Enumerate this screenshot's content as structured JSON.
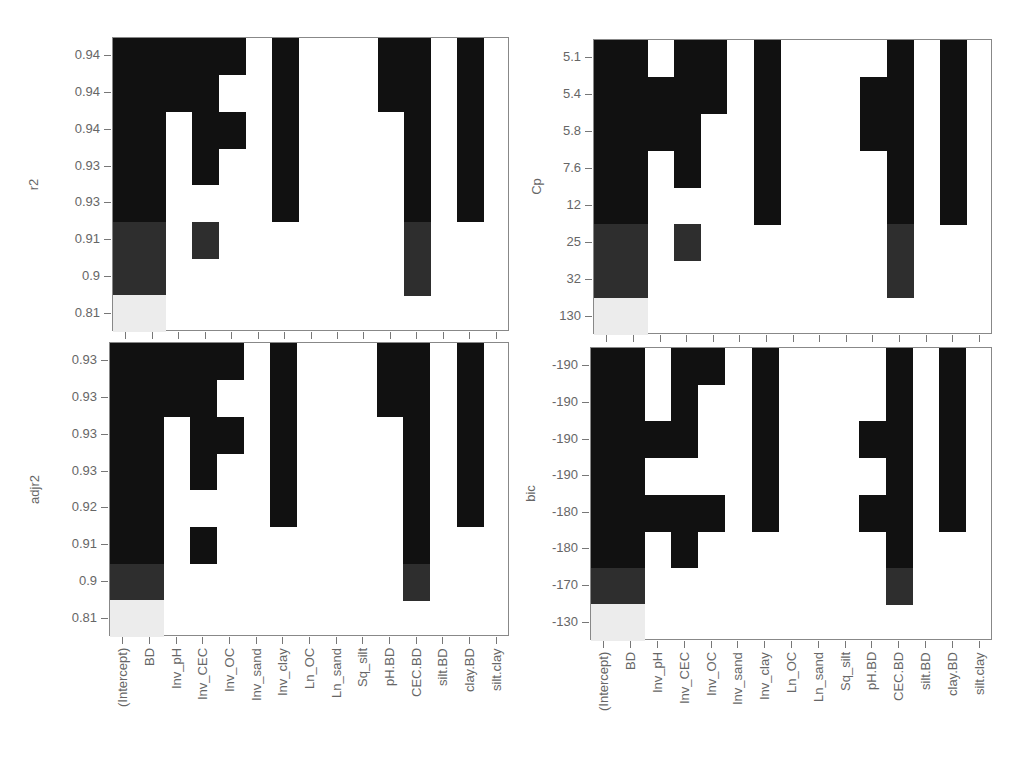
{
  "figure": {
    "columns": [
      "(Intercept)",
      "BD",
      "Inv_pH",
      "Inv_CEC",
      "Inv_OC",
      "Inv_sand",
      "Inv_clay",
      "Ln_OC",
      "Ln_sand",
      "Sq_silt",
      "pH.BD",
      "CEC.BD",
      "silt.BD",
      "clay.BD",
      "silt.clay"
    ],
    "shade_colors": {
      "0": "#ffffff",
      "1": "#ececec",
      "2": "#2e2e2e",
      "3": "#111111"
    }
  },
  "chart_data": [
    {
      "type": "heatmap",
      "title": "",
      "ylabel": "r2",
      "xlabel": "",
      "x": [
        "(Intercept)",
        "BD",
        "Inv_pH",
        "Inv_CEC",
        "Inv_OC",
        "Inv_sand",
        "Inv_clay",
        "Ln_OC",
        "Ln_sand",
        "Sq_silt",
        "pH.BD",
        "CEC.BD",
        "silt.BD",
        "clay.BD",
        "silt.clay"
      ],
      "y_tick_labels": [
        "0.94",
        "0.94",
        "0.94",
        "0.93",
        "0.93",
        "0.91",
        "0.9",
        "0.81"
      ],
      "row_shade": [
        3,
        3,
        3,
        3,
        3,
        2,
        2,
        1
      ],
      "included": [
        [
          1,
          1,
          1,
          1,
          1,
          0,
          1,
          0,
          0,
          0,
          1,
          1,
          0,
          1,
          0
        ],
        [
          1,
          1,
          1,
          1,
          0,
          0,
          1,
          0,
          0,
          0,
          1,
          1,
          0,
          1,
          0
        ],
        [
          1,
          1,
          0,
          1,
          1,
          0,
          1,
          0,
          0,
          0,
          0,
          1,
          0,
          1,
          0
        ],
        [
          1,
          1,
          0,
          1,
          0,
          0,
          1,
          0,
          0,
          0,
          0,
          1,
          0,
          1,
          0
        ],
        [
          1,
          1,
          0,
          0,
          0,
          0,
          1,
          0,
          0,
          0,
          0,
          1,
          0,
          1,
          0
        ],
        [
          1,
          1,
          0,
          1,
          0,
          0,
          0,
          0,
          0,
          0,
          0,
          1,
          0,
          0,
          0
        ],
        [
          1,
          1,
          0,
          0,
          0,
          0,
          0,
          0,
          0,
          0,
          0,
          1,
          0,
          0,
          0
        ],
        [
          1,
          1,
          0,
          0,
          0,
          0,
          0,
          0,
          0,
          0,
          0,
          0,
          0,
          0,
          0
        ]
      ]
    },
    {
      "type": "heatmap",
      "title": "",
      "ylabel": "Cp",
      "xlabel": "",
      "x": [
        "(Intercept)",
        "BD",
        "Inv_pH",
        "Inv_CEC",
        "Inv_OC",
        "Inv_sand",
        "Inv_clay",
        "Ln_OC",
        "Ln_sand",
        "Sq_silt",
        "pH.BD",
        "CEC.BD",
        "silt.BD",
        "clay.BD",
        "silt.clay"
      ],
      "y_tick_labels": [
        "5.1",
        "5.4",
        "5.8",
        "7.6",
        "12",
        "25",
        "32",
        "130"
      ],
      "row_shade": [
        3,
        3,
        3,
        3,
        3,
        2,
        2,
        1
      ],
      "included": [
        [
          1,
          1,
          0,
          1,
          1,
          0,
          1,
          0,
          0,
          0,
          0,
          1,
          0,
          1,
          0
        ],
        [
          1,
          1,
          1,
          1,
          1,
          0,
          1,
          0,
          0,
          0,
          1,
          1,
          0,
          1,
          0
        ],
        [
          1,
          1,
          1,
          1,
          0,
          0,
          1,
          0,
          0,
          0,
          1,
          1,
          0,
          1,
          0
        ],
        [
          1,
          1,
          0,
          1,
          0,
          0,
          1,
          0,
          0,
          0,
          0,
          1,
          0,
          1,
          0
        ],
        [
          1,
          1,
          0,
          0,
          0,
          0,
          1,
          0,
          0,
          0,
          0,
          1,
          0,
          1,
          0
        ],
        [
          1,
          1,
          0,
          1,
          0,
          0,
          0,
          0,
          0,
          0,
          0,
          1,
          0,
          0,
          0
        ],
        [
          1,
          1,
          0,
          0,
          0,
          0,
          0,
          0,
          0,
          0,
          0,
          1,
          0,
          0,
          0
        ],
        [
          1,
          1,
          0,
          0,
          0,
          0,
          0,
          0,
          0,
          0,
          0,
          0,
          0,
          0,
          0
        ]
      ]
    },
    {
      "type": "heatmap",
      "title": "",
      "ylabel": "adjr2",
      "xlabel": "",
      "x": [
        "(Intercept)",
        "BD",
        "Inv_pH",
        "Inv_CEC",
        "Inv_OC",
        "Inv_sand",
        "Inv_clay",
        "Ln_OC",
        "Ln_sand",
        "Sq_silt",
        "pH.BD",
        "CEC.BD",
        "silt.BD",
        "clay.BD",
        "silt.clay"
      ],
      "y_tick_labels": [
        "0.93",
        "0.93",
        "0.93",
        "0.93",
        "0.92",
        "0.91",
        "0.9",
        "0.81"
      ],
      "row_shade": [
        3,
        3,
        3,
        3,
        3,
        3,
        2,
        1
      ],
      "included": [
        [
          1,
          1,
          1,
          1,
          1,
          0,
          1,
          0,
          0,
          0,
          1,
          1,
          0,
          1,
          0
        ],
        [
          1,
          1,
          1,
          1,
          0,
          0,
          1,
          0,
          0,
          0,
          1,
          1,
          0,
          1,
          0
        ],
        [
          1,
          1,
          0,
          1,
          1,
          0,
          1,
          0,
          0,
          0,
          0,
          1,
          0,
          1,
          0
        ],
        [
          1,
          1,
          0,
          1,
          0,
          0,
          1,
          0,
          0,
          0,
          0,
          1,
          0,
          1,
          0
        ],
        [
          1,
          1,
          0,
          0,
          0,
          0,
          1,
          0,
          0,
          0,
          0,
          1,
          0,
          1,
          0
        ],
        [
          1,
          1,
          0,
          1,
          0,
          0,
          0,
          0,
          0,
          0,
          0,
          1,
          0,
          0,
          0
        ],
        [
          1,
          1,
          0,
          0,
          0,
          0,
          0,
          0,
          0,
          0,
          0,
          1,
          0,
          0,
          0
        ],
        [
          1,
          1,
          0,
          0,
          0,
          0,
          0,
          0,
          0,
          0,
          0,
          0,
          0,
          0,
          0
        ]
      ]
    },
    {
      "type": "heatmap",
      "title": "",
      "ylabel": "bic",
      "xlabel": "",
      "x": [
        "(Intercept)",
        "BD",
        "Inv_pH",
        "Inv_CEC",
        "Inv_OC",
        "Inv_sand",
        "Inv_clay",
        "Ln_OC",
        "Ln_sand",
        "Sq_silt",
        "pH.BD",
        "CEC.BD",
        "silt.BD",
        "clay.BD",
        "silt.clay"
      ],
      "y_tick_labels": [
        "-190",
        "-190",
        "-190",
        "-190",
        "-180",
        "-180",
        "-170",
        "-130"
      ],
      "row_shade": [
        3,
        3,
        3,
        3,
        3,
        3,
        2,
        1
      ],
      "included": [
        [
          1,
          1,
          0,
          1,
          1,
          0,
          1,
          0,
          0,
          0,
          0,
          1,
          0,
          1,
          0
        ],
        [
          1,
          1,
          0,
          1,
          0,
          0,
          1,
          0,
          0,
          0,
          0,
          1,
          0,
          1,
          0
        ],
        [
          1,
          1,
          1,
          1,
          0,
          0,
          1,
          0,
          0,
          0,
          1,
          1,
          0,
          1,
          0
        ],
        [
          1,
          1,
          0,
          0,
          0,
          0,
          1,
          0,
          0,
          0,
          0,
          1,
          0,
          1,
          0
        ],
        [
          1,
          1,
          1,
          1,
          1,
          0,
          1,
          0,
          0,
          0,
          1,
          1,
          0,
          1,
          0
        ],
        [
          1,
          1,
          0,
          1,
          0,
          0,
          0,
          0,
          0,
          0,
          0,
          1,
          0,
          0,
          0
        ],
        [
          1,
          1,
          0,
          0,
          0,
          0,
          0,
          0,
          0,
          0,
          0,
          1,
          0,
          0,
          0
        ],
        [
          1,
          1,
          0,
          0,
          0,
          0,
          0,
          0,
          0,
          0,
          0,
          0,
          0,
          0,
          0
        ]
      ]
    }
  ]
}
